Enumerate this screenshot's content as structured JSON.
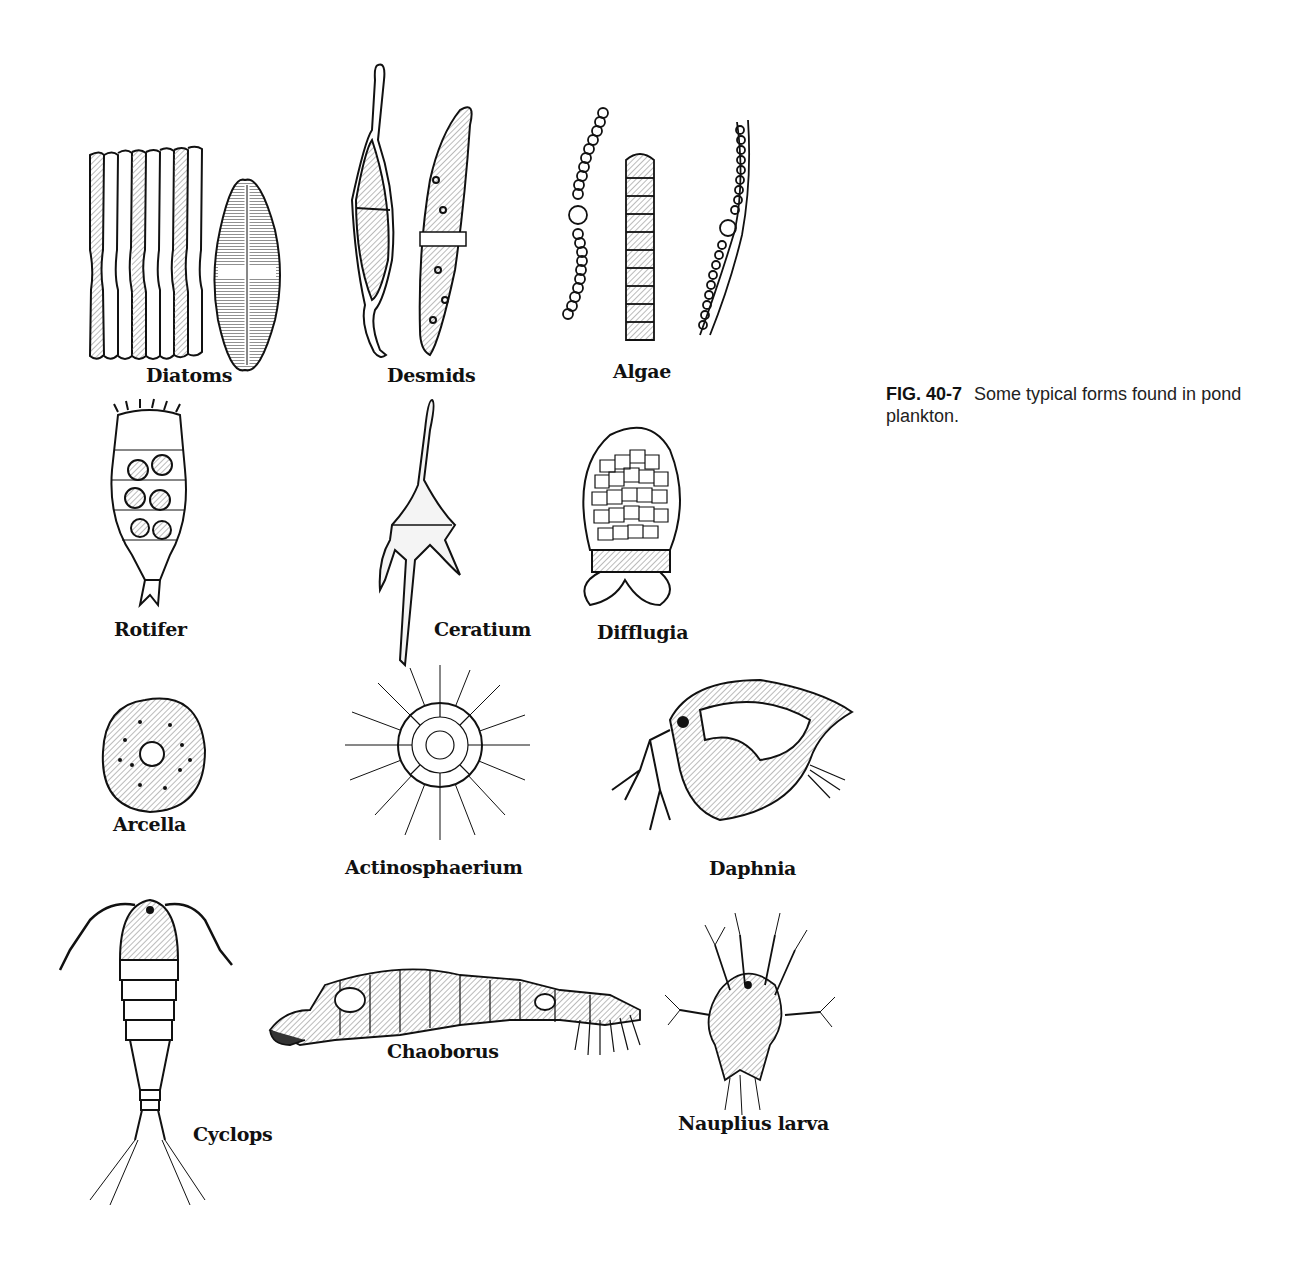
{
  "caption": {
    "figure_number": "FIG. 40-7",
    "text": "Some typical forms found in pond plankton."
  },
  "labels": {
    "diatoms": "Diatoms",
    "desmids": "Desmids",
    "algae": "Algae",
    "rotifer": "Rotifer",
    "ceratium": "Ceratium",
    "difflugia": "Difflugia",
    "arcella": "Arcella",
    "actinosphaerium": "Actinosphaerium",
    "daphnia": "Daphnia",
    "cyclops": "Cyclops",
    "chaoborus": "Chaoborus",
    "nauplius": "Nauplius larva"
  },
  "colors": {
    "ink": "#111111",
    "shade": "#9a9a9a",
    "background": "#ffffff"
  }
}
